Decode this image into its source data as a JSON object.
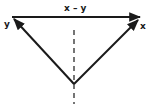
{
  "diagram": {
    "type": "vector-triangle",
    "vectors": [
      {
        "id": "x_minus_y",
        "label": "x – y",
        "from": [
          12,
          17
        ],
        "to": [
          141,
          17
        ]
      },
      {
        "id": "y",
        "label": "y",
        "from": [
          74,
          84
        ],
        "to": [
          12,
          17
        ]
      },
      {
        "id": "x",
        "label": "x",
        "from": [
          74,
          84
        ],
        "to": [
          140,
          18
        ]
      }
    ],
    "axis": {
      "style": "dashed",
      "x": 74,
      "y1": 30,
      "y2": 104
    },
    "colors": {
      "stroke": "#1a1a1a",
      "background": "#ffffff"
    }
  }
}
